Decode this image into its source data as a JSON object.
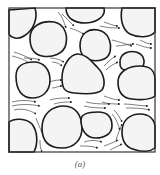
{
  "figure": {
    "caption": "(a)",
    "frame": {
      "x": 9,
      "y": 8,
      "width": 146,
      "height": 144
    },
    "colors": {
      "grain_fill": "#f4f4f4",
      "grain_stroke": "#1c1c1c",
      "stream": "#2a2a2a",
      "background": "#ffffff"
    },
    "grains": [
      {
        "id": "grain-top-left",
        "d": "M9,10 L35,8 C38,18 34,30 24,36 C18,40 11,38 9,34 Z"
      },
      {
        "id": "grain-upper-left",
        "d": "M30,38 C30,26 42,20 54,22 C64,24 68,34 66,44 C64,54 52,58 42,56 C32,54 30,46 30,38 Z"
      },
      {
        "id": "grain-top-center",
        "d": "M66,8 L104,8 C106,16 98,22 86,23 C74,23 66,18 66,8 Z"
      },
      {
        "id": "grain-top-right",
        "d": "M122,8 L155,8 L155,32 C150,38 138,38 130,34 C122,30 120,18 122,8 Z"
      },
      {
        "id": "grain-center-upper",
        "d": "M80,46 C80,34 88,28 98,30 C108,32 112,42 110,52 C108,60 98,62 90,60 C82,58 80,52 80,46 Z"
      },
      {
        "id": "grain-right-small",
        "d": "M120,62 C120,54 128,50 136,52 C144,54 146,62 142,68 C138,72 128,72 124,70 C120,68 120,66 120,62 Z"
      },
      {
        "id": "grain-center-triangle",
        "d": "M62,78 C62,66 70,54 78,54 C86,54 92,62 98,68 C104,74 106,84 102,90 C98,94 84,94 74,93 C64,92 62,88 62,78 Z"
      },
      {
        "id": "grain-left-mid",
        "d": "M16,76 C16,66 24,62 34,62 C44,62 50,70 50,80 C50,92 42,98 32,98 C22,98 16,90 16,76 Z"
      },
      {
        "id": "grain-right-mid",
        "d": "M118,82 C118,72 128,66 140,66 C152,66 155,72 155,80 L155,96 C150,100 140,100 132,99 C122,98 118,92 118,82 Z"
      },
      {
        "id": "grain-bottom-left",
        "d": "M9,122 C14,118 26,118 32,124 C38,132 38,144 34,152 L9,152 Z"
      },
      {
        "id": "grain-bottom-center",
        "d": "M42,128 C42,114 52,106 64,106 C76,106 82,116 82,128 C82,140 74,148 62,148 C50,148 42,142 42,128 Z"
      },
      {
        "id": "grain-bottom-center-right",
        "d": "M81,120 C81,114 88,112 98,112 C108,112 112,118 112,126 C112,134 104,138 96,138 C86,138 81,130 81,120 Z"
      },
      {
        "id": "grain-bottom-right",
        "d": "M122,132 C122,120 130,114 140,114 C150,114 155,120 155,128 L155,148 C150,152 142,152 136,150 C126,148 122,142 122,132 Z"
      }
    ],
    "streamlines": [
      {
        "d": "M14,52 C20,54 26,56 32,60"
      },
      {
        "d": "M12,56 C20,58 26,60 30,64"
      },
      {
        "d": "M24,58 C30,58 34,58 40,60"
      },
      {
        "d": "M50,58 C56,58 60,60 64,62"
      },
      {
        "d": "M52,62 C56,62 60,64 62,66"
      },
      {
        "d": "M58,12 C62,16 64,22 66,28"
      },
      {
        "d": "M62,14 C66,18 70,22 74,26"
      },
      {
        "d": "M70,28 C76,30 80,32 84,34"
      },
      {
        "d": "M104,22 C110,24 114,26 118,26"
      },
      {
        "d": "M100,26 C108,28 114,28 120,28"
      },
      {
        "d": "M112,40 C120,42 126,44 132,46"
      },
      {
        "d": "M116,46 C122,46 128,44 134,44"
      },
      {
        "d": "M140,40 C144,42 148,44 152,44"
      },
      {
        "d": "M136,44 C142,46 146,48 152,48"
      },
      {
        "d": "M104,66 C108,62 112,58 116,56"
      },
      {
        "d": "M106,70 C110,66 114,64 118,62"
      },
      {
        "d": "M50,82 C54,80 58,80 62,80"
      },
      {
        "d": "M52,88 C56,88 58,86 62,86"
      },
      {
        "d": "M12,102 C20,100 28,100 36,102"
      },
      {
        "d": "M12,106 C20,104 30,104 40,106"
      },
      {
        "d": "M14,110 C22,108 30,110 36,114"
      },
      {
        "d": "M50,100 C56,98 62,98 70,98"
      },
      {
        "d": "M54,104 C60,102 66,102 72,102"
      },
      {
        "d": "M104,96 C110,98 114,100 120,100"
      },
      {
        "d": "M102,102 C108,104 114,104 120,104"
      },
      {
        "d": "M84,106 C92,108 100,108 106,108"
      },
      {
        "d": "M86,102 C94,104 102,104 110,104"
      },
      {
        "d": "M124,104 C132,104 140,106 148,106"
      },
      {
        "d": "M126,108 C134,108 142,108 150,110"
      },
      {
        "d": "M112,114 C116,118 118,124 120,130"
      },
      {
        "d": "M114,110 C118,114 120,118 122,122"
      },
      {
        "d": "M116,140 C118,134 120,128 122,124"
      },
      {
        "d": "M40,140 C40,144 40,148 42,152"
      },
      {
        "d": "M36,118 C38,124 40,128 42,132"
      },
      {
        "d": "M84,142 C90,140 96,140 102,142"
      },
      {
        "d": "M80,146 C86,146 92,146 98,148"
      },
      {
        "d": "M104,146 C110,144 114,142 118,140"
      },
      {
        "d": "M110,150 C114,148 118,146 122,144"
      }
    ]
  }
}
